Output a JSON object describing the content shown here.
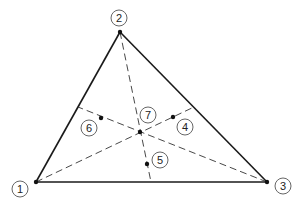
{
  "diagram": {
    "type": "triangle-element-nodes",
    "colors": {
      "line": "#1a1a1a",
      "label_circle": "#555555",
      "background": "#ffffff"
    },
    "vertices": [
      {
        "id": "1",
        "label": "1",
        "x": 36,
        "y": 182,
        "lx": 20,
        "ly": 189
      },
      {
        "id": "2",
        "label": "2",
        "x": 120,
        "y": 32,
        "lx": 119,
        "ly": 18
      },
      {
        "id": "3",
        "label": "3",
        "x": 267,
        "y": 182,
        "lx": 283,
        "ly": 186
      }
    ],
    "interior_nodes": [
      {
        "id": "4",
        "label": "4",
        "x": 173,
        "y": 117,
        "lx": 185,
        "ly": 127
      },
      {
        "id": "5",
        "label": "5",
        "x": 147,
        "y": 164,
        "lx": 160,
        "ly": 160
      },
      {
        "id": "6",
        "label": "6",
        "x": 101,
        "y": 118,
        "lx": 89,
        "ly": 128
      },
      {
        "id": "7",
        "label": "7",
        "x": 140,
        "y": 132,
        "lx": 148,
        "ly": 115
      }
    ],
    "medians": [
      {
        "from": "1",
        "to_side": "2-3",
        "x1": 36,
        "y1": 182,
        "x2": 194,
        "y2": 107
      },
      {
        "from": "2",
        "to_side": "1-3",
        "x1": 120,
        "y1": 32,
        "x2": 151,
        "y2": 182
      },
      {
        "from": "3",
        "to_side": "1-2",
        "x1": 267,
        "y1": 182,
        "x2": 78,
        "y2": 107
      }
    ]
  }
}
